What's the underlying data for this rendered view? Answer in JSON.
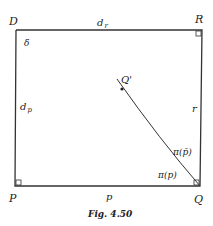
{
  "figure": {
    "caption": "Fig. 4.50",
    "vertices": {
      "D": "D",
      "R": "R",
      "P": "P",
      "Q": "Q"
    },
    "edge_labels": {
      "top": "d",
      "top_sub": "r",
      "left": "d",
      "left_sub": "p",
      "right": "r",
      "bottom": "p"
    },
    "angle_label": "δ",
    "curve_point": "Q'",
    "curve_labels": {
      "upper": "π(p̄)",
      "lower": "π(p)"
    },
    "colors": {
      "stroke": "#333333",
      "text": "#222222"
    }
  }
}
